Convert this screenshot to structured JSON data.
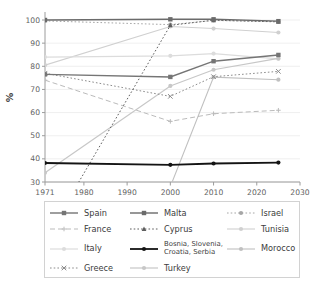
{
  "axes": {
    "ylabel": "%",
    "y_ticks": [
      30,
      40,
      50,
      60,
      70,
      80,
      90,
      100
    ],
    "x_ticks": [
      1971,
      1980,
      1990,
      2000,
      2010,
      2020,
      2030
    ],
    "tick_color": "#5f5f5f",
    "axis_color": "#9c9c9c",
    "grid_color": "#ebebeb"
  },
  "chart_data": {
    "type": "line",
    "title": "",
    "xlabel": "",
    "ylabel": "%",
    "x": [
      1971,
      2000,
      2010,
      2025
    ],
    "xlim": [
      1971,
      2030
    ],
    "ylim": [
      30,
      100
    ],
    "grid": "horizontal",
    "legend_position": "bottom",
    "series": [
      {
        "name": "Tunisia",
        "values": [
          80.5,
          97.2,
          96.3,
          94.6
        ],
        "color": "#d0d0d0",
        "style": "solid",
        "marker": "circle",
        "width": 1.1
      },
      {
        "name": "Italy",
        "values": [
          84.0,
          84.5,
          85.5,
          83.2
        ],
        "color": "#dcdcdc",
        "style": "solid",
        "marker": "circle",
        "width": 1.2
      },
      {
        "name": "Turkey",
        "values": [
          34.0,
          71.5,
          78.5,
          83.4
        ],
        "color": "#c7c7c7",
        "style": "solid",
        "marker": "circle",
        "width": 1.2
      },
      {
        "name": "Morocco",
        "values": [
          null,
          28.0,
          75.3,
          74.2
        ],
        "color": "#c0c0c0",
        "style": "solid",
        "marker": "circle",
        "width": 1.1
      },
      {
        "name": "France",
        "values": [
          74.0,
          56.2,
          59.5,
          61.0
        ],
        "color": "#bbbbbb",
        "style": "dashed",
        "marker": "plus",
        "width": 1.0
      },
      {
        "name": "Israel",
        "values": [
          99.6,
          98.0,
          99.8,
          99.3
        ],
        "color": "#a6a6a6",
        "style": "dotted",
        "marker": "circle",
        "width": 1.0
      },
      {
        "name": "Greece",
        "values": [
          77.0,
          67.0,
          75.5,
          77.8
        ],
        "color": "#8c8c8c",
        "style": "dotted",
        "marker": "x",
        "width": 1.0
      },
      {
        "name": "Cyprus",
        "values": [
          5.0,
          97.7,
          99.9,
          99.2
        ],
        "color": "#5e5e5e",
        "style": "dotted",
        "marker": "triangle",
        "width": 1.0
      },
      {
        "name": "Spain",
        "values": [
          76.5,
          75.4,
          82.2,
          84.9
        ],
        "color": "#757575",
        "style": "solid",
        "marker": "square",
        "width": 1.4
      },
      {
        "name": "Malta",
        "values": [
          100.0,
          100.3,
          100.3,
          99.5
        ],
        "color": "#6b6b6b",
        "style": "solid",
        "marker": "square",
        "width": 1.4
      },
      {
        "name": "Bosnia, Slovenia, Croatia, Serbia",
        "values": [
          38.2,
          37.4,
          38.0,
          38.4
        ],
        "color": "#141414",
        "style": "solid",
        "marker": "circle",
        "width": 1.8
      }
    ],
    "legend_grid": [
      [
        "Spain",
        "Malta",
        "Israel"
      ],
      [
        "France",
        "Cyprus",
        "Tunisia"
      ],
      [
        "Italy",
        "Bosnia, Slovenia, Croatia, Serbia",
        "Morocco"
      ],
      [
        "Greece",
        "Turkey",
        ""
      ]
    ]
  }
}
